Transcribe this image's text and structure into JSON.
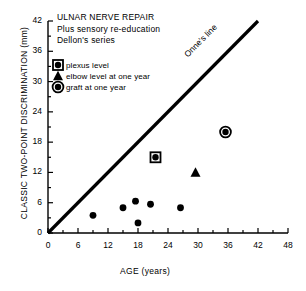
{
  "chart_data": {
    "type": "scatter",
    "title_lines": [
      "ULNAR NERVE REPAIR",
      "Plus sensory re-education",
      "Dellon's series"
    ],
    "xlabel": "AGE (years)",
    "ylabel": "CLASSIC TWO-POINT DISCRIMINATION (mm)",
    "xlim": [
      0,
      48
    ],
    "ylim": [
      0,
      42
    ],
    "xticks": [
      0,
      6,
      12,
      18,
      24,
      30,
      36,
      42,
      48
    ],
    "yticks": [
      0,
      6,
      12,
      18,
      24,
      30,
      36,
      42
    ],
    "xtick_labels": [
      "0",
      "6",
      "12",
      "18",
      "24",
      "30",
      "36",
      "42",
      "48"
    ],
    "ytick_labels": [
      "0",
      "6",
      "12",
      "18",
      "24",
      "30",
      "36",
      "42"
    ],
    "minor_ticks": true,
    "grid": false,
    "legend_position": "upper left",
    "annotations": [
      {
        "text": "Onne's line",
        "x": 22,
        "y": 26,
        "rotation": -45
      }
    ],
    "reference_line": {
      "name": "Onne's line",
      "x": [
        0,
        42
      ],
      "y": [
        0,
        42
      ],
      "slope": 1,
      "intercept": 0
    },
    "series": [
      {
        "name": "plexus level",
        "marker": "square-dot",
        "points": [
          {
            "x": 21.5,
            "y": 15
          }
        ]
      },
      {
        "name": "elbow level at one year",
        "marker": "triangle",
        "points": [
          {
            "x": 29.5,
            "y": 12
          }
        ]
      },
      {
        "name": "graft at one year",
        "marker": "circle-dot",
        "points": [
          {
            "x": 35.5,
            "y": 20
          }
        ]
      },
      {
        "name": "unmarked cases",
        "marker": "dot",
        "points": [
          {
            "x": 9,
            "y": 3.5
          },
          {
            "x": 15,
            "y": 5
          },
          {
            "x": 17.5,
            "y": 6.3
          },
          {
            "x": 18,
            "y": 2
          },
          {
            "x": 20.5,
            "y": 5.7
          },
          {
            "x": 26.5,
            "y": 5
          }
        ]
      }
    ]
  },
  "legend": {
    "items": [
      {
        "label": "plexus level",
        "marker": "square-dot"
      },
      {
        "label": "elbow level at one year",
        "marker": "triangle"
      },
      {
        "label": "graft at one year",
        "marker": "circle-dot"
      }
    ]
  },
  "colors": {
    "ink": "#000000",
    "background": "#ffffff"
  }
}
